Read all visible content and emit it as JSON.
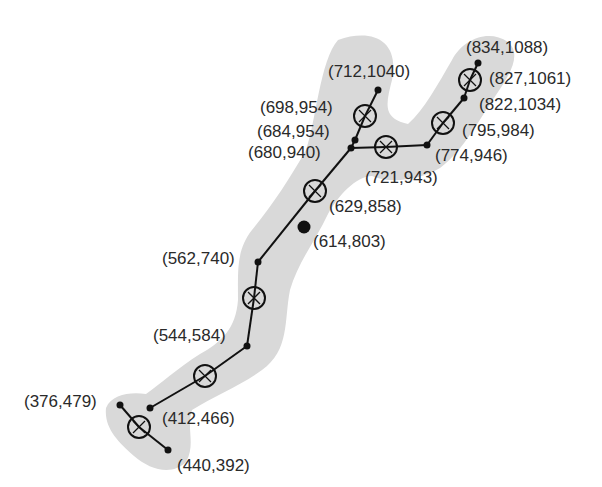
{
  "colors": {
    "shape": "#d9d9d9",
    "line": "#111111",
    "text": "#2a2a2a"
  },
  "shape_outline": "M338,40 C372,28 400,40 392,80 C386,104 382,118 408,124 C424,110 438,84 452,60 C462,40 488,28 508,42 C522,54 510,74 498,92 C480,118 464,150 440,168 C420,180 390,184 372,176 C356,176 338,196 328,214 C316,240 298,262 290,290 C284,320 290,350 262,370 C240,386 214,396 192,410 C186,428 196,444 186,462 C172,476 150,470 134,456 C118,442 104,428 106,408 C112,394 130,392 146,394 C160,384 178,368 200,354 C222,342 236,328 238,300 C238,272 236,250 252,230 C272,206 290,178 306,150 C316,122 320,60 338,40 Z",
  "edges": [
    [
      478,
      63,
      470,
      80
    ],
    [
      470,
      80,
      464,
      98
    ],
    [
      464,
      98,
      443,
      123
    ],
    [
      443,
      123,
      427,
      145
    ],
    [
      427,
      145,
      386,
      147
    ],
    [
      386,
      147,
      351,
      148
    ],
    [
      378,
      90,
      365,
      116
    ],
    [
      365,
      116,
      355,
      140
    ],
    [
      355,
      140,
      351,
      148
    ],
    [
      351,
      148,
      315,
      191
    ],
    [
      315,
      191,
      258,
      262
    ],
    [
      258,
      262,
      254,
      298
    ],
    [
      254,
      298,
      247,
      346
    ],
    [
      247,
      346,
      205,
      376
    ],
    [
      205,
      376,
      150,
      408
    ],
    [
      120,
      405,
      139,
      427
    ],
    [
      139,
      427,
      168,
      450
    ]
  ],
  "nodes": [
    {
      "x": 478,
      "y": 63,
      "r": 3.5,
      "label": "(834,1088)",
      "lx": 466,
      "ly": 53
    },
    {
      "x": 464,
      "y": 98,
      "r": 3.5,
      "label": "(822,1034)",
      "lx": 479,
      "ly": 110
    },
    {
      "x": 427,
      "y": 145,
      "r": 3.5,
      "label": "(774,946)",
      "lx": 435,
      "ly": 161
    },
    {
      "x": 378,
      "y": 90,
      "r": 3.5,
      "label": "(712,1040)",
      "lx": 328,
      "ly": 77
    },
    {
      "x": 355,
      "y": 140,
      "r": 3.5,
      "label": "(684,954)",
      "lx": 257,
      "ly": 137
    },
    {
      "x": 351,
      "y": 148,
      "r": 3.5,
      "label": "(680,940)",
      "lx": 248,
      "ly": 158
    },
    {
      "x": 304,
      "y": 227,
      "r": 6.5,
      "label": "(614,803)",
      "lx": 313,
      "ly": 247
    },
    {
      "x": 258,
      "y": 262,
      "r": 3.5,
      "label": "(562,740)",
      "lx": 162,
      "ly": 264
    },
    {
      "x": 247,
      "y": 346,
      "r": 3.5,
      "label": "(544,584)",
      "lx": 153,
      "ly": 341
    },
    {
      "x": 150,
      "y": 408,
      "r": 3.5,
      "label": "(412,466)",
      "lx": 162,
      "ly": 424
    },
    {
      "x": 120,
      "y": 405,
      "r": 3.5,
      "label": "(376,479)",
      "lx": 24,
      "ly": 407
    },
    {
      "x": 168,
      "y": 450,
      "r": 3.5,
      "label": "(440,392)",
      "lx": 177,
      "ly": 471
    }
  ],
  "junctions": [
    {
      "x": 470,
      "y": 80,
      "label": "(827,1061)",
      "lx": 489,
      "ly": 84
    },
    {
      "x": 443,
      "y": 123,
      "label": "(795,984)",
      "lx": 462,
      "ly": 136
    },
    {
      "x": 386,
      "y": 147,
      "label": "(721,943)",
      "lx": 365,
      "ly": 183
    },
    {
      "x": 365,
      "y": 116,
      "label": "(698,954)",
      "lx": 260,
      "ly": 113
    },
    {
      "x": 315,
      "y": 191,
      "label": "(629,858)",
      "lx": 329,
      "ly": 212
    },
    {
      "x": 254,
      "y": 298,
      "label": "",
      "lx": 0,
      "ly": 0
    },
    {
      "x": 205,
      "y": 376,
      "label": "",
      "lx": 0,
      "ly": 0
    },
    {
      "x": 139,
      "y": 427,
      "label": "",
      "lx": 0,
      "ly": 0
    }
  ]
}
